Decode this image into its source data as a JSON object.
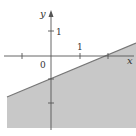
{
  "figure": {
    "type": "inequality-graph",
    "inequality": "y ≤ x/2 − 1",
    "boundary_line": {
      "equation": "y = x/2 − 1",
      "slope": 0.5,
      "intercept": -1,
      "style": "solid"
    },
    "shaded_region": "below line",
    "colors": {
      "shade": "#c8c8c8",
      "line": "#777777",
      "axis": "#555555"
    },
    "axes": {
      "x_label": "x",
      "y_label": "y",
      "origin_label": "0",
      "x_tick_label": "1",
      "y_tick_label": "1",
      "x_ticks": [
        -1,
        1,
        2
      ],
      "y_ticks": [
        1,
        -1,
        -2
      ]
    }
  }
}
